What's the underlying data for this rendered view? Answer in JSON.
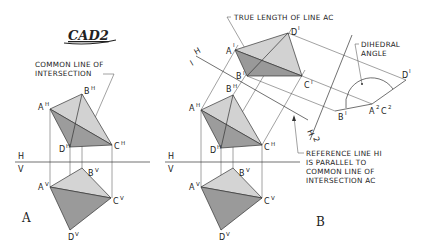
{
  "logo": {
    "text": "CAD2"
  },
  "panel_a": {
    "letter": "A",
    "callout": [
      "COMMON LINE OF",
      "INTERSECTION"
    ],
    "fold_line": {
      "upper": "H",
      "lower": "V"
    },
    "points_top": {
      "A": "A",
      "B": "B",
      "C": "C",
      "D": "D",
      "sup": "H"
    },
    "points_front": {
      "A": "A",
      "B": "B",
      "C": "C",
      "D": "D",
      "sup": "V"
    }
  },
  "panel_b": {
    "letter": "B",
    "callout_true_length": "TRUE LENGTH OF LINE AC",
    "callout_dihedral": [
      "DIHEDRAL",
      "ANGLE"
    ],
    "callout_reference": [
      "REFERENCE LINE HI",
      "IS PARALLEL  TO",
      "COMMON LINE OF",
      "INTERSECTION  AC"
    ],
    "fold_line": {
      "upper": "H",
      "lower": "V"
    },
    "fold_line_h1": {
      "upper": "H",
      "lower": "I"
    },
    "fold_line_12": {
      "a": "I",
      "b": "2"
    },
    "points_top": {
      "sup": "H"
    },
    "points_front": {
      "sup": "V"
    },
    "points_aux1": {
      "sup": "I"
    },
    "points_aux2": {
      "B": "B",
      "B_sup": "I",
      "AC": "A",
      "AC_sup": "2",
      "C": "C",
      "C_sup": "2",
      "D": "D",
      "D_sup": "I"
    }
  },
  "colors": {
    "light_face": "#d4d4d4",
    "dark_face": "#9a9a9a",
    "mid_face": "#b8b8b8",
    "line": "#333333"
  }
}
